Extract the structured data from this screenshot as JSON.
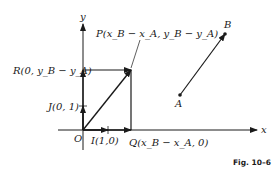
{
  "figure": {
    "caption": "Fig. 10–6",
    "axes": {
      "x_label": "x",
      "y_label": "y",
      "origin_label": "O"
    },
    "points": {
      "P": "P(x_B − x_A, y_B − y_A)",
      "R": "R(0, y_B − y_A)",
      "J": "J(0, 1)",
      "I": "I(1,0)",
      "Q": "Q(x_B − x_A, 0)",
      "A": "A",
      "B": "B"
    },
    "colors": {
      "ink": "#1a1a1a",
      "background": "#ffffff"
    }
  }
}
